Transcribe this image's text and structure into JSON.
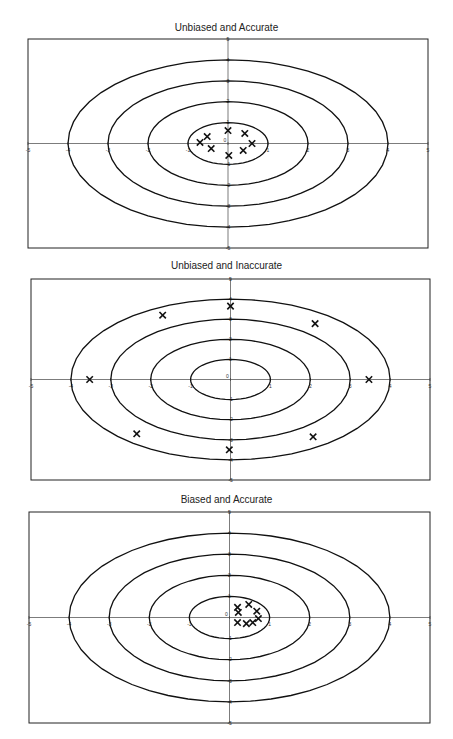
{
  "chart_data": [
    {
      "type": "scatter",
      "title": "Unbiased and Accurate",
      "xlim": [
        -5,
        5
      ],
      "ylim": [
        -5,
        5
      ],
      "x_ticks": [
        -5,
        -4,
        -3,
        -2,
        -1,
        0,
        1,
        2,
        3,
        4,
        5
      ],
      "y_ticks": [
        -5,
        -4,
        -3,
        -2,
        -1,
        0,
        1,
        2,
        3,
        4,
        5
      ],
      "rings": [
        1,
        2,
        3,
        4
      ],
      "points": [
        [
          -0.7,
          0.05
        ],
        [
          -0.52,
          0.33
        ],
        [
          -0.42,
          -0.24
        ],
        [
          0.0,
          0.62
        ],
        [
          0.42,
          0.48
        ],
        [
          0.6,
          0.0
        ],
        [
          0.38,
          -0.33
        ],
        [
          0.02,
          -0.57
        ]
      ]
    },
    {
      "type": "scatter",
      "title": "Unbiased and Inaccurate",
      "xlim": [
        -5,
        5
      ],
      "ylim": [
        -5,
        5
      ],
      "x_ticks": [
        -5,
        -4,
        -3,
        -2,
        -1,
        0,
        1,
        2,
        3,
        4,
        5
      ],
      "y_ticks": [
        -5,
        -4,
        -3,
        -2,
        -1,
        0,
        1,
        2,
        3,
        4,
        5
      ],
      "rings": [
        1,
        2,
        3,
        4
      ],
      "points": [
        [
          -1.7,
          3.2
        ],
        [
          0.0,
          3.65
        ],
        [
          2.12,
          2.78
        ],
        [
          -3.53,
          0.0
        ],
        [
          3.47,
          0.0
        ],
        [
          -2.35,
          -2.7
        ],
        [
          2.07,
          -2.85
        ],
        [
          -0.03,
          -3.5
        ]
      ]
    },
    {
      "type": "scatter",
      "title": "Biased and Accurate",
      "xlim": [
        -5,
        5
      ],
      "ylim": [
        -5,
        5
      ],
      "x_ticks": [
        -5,
        -4,
        -3,
        -2,
        -1,
        0,
        1,
        2,
        3,
        4,
        5
      ],
      "y_ticks": [
        -5,
        -4,
        -3,
        -2,
        -1,
        0,
        1,
        2,
        3,
        4,
        5
      ],
      "rings": [
        1,
        2,
        3,
        4
      ],
      "points": [
        [
          0.2,
          0.48
        ],
        [
          0.22,
          0.24
        ],
        [
          0.48,
          0.62
        ],
        [
          0.68,
          0.3
        ],
        [
          0.2,
          -0.24
        ],
        [
          0.42,
          -0.29
        ],
        [
          0.58,
          -0.24
        ],
        [
          0.72,
          -0.05
        ]
      ]
    }
  ]
}
